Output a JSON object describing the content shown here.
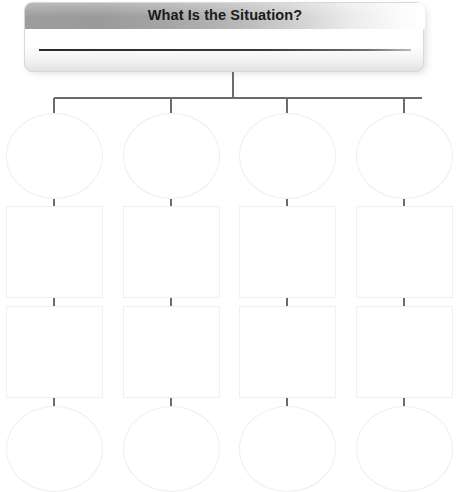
{
  "worksheet": {
    "header": {
      "title": "What Is the Situation?",
      "answer_line_value": "",
      "answer_line_placeholder": ""
    },
    "diagram": {
      "type": "tree-organizer",
      "branch_count": 4,
      "rows_per_branch": 4,
      "row_shapes": [
        "circle",
        "square",
        "square",
        "circle"
      ],
      "columns": [
        {
          "id": "branch-1",
          "nodes": [
            {
              "shape": "circle",
              "value": ""
            },
            {
              "shape": "square",
              "value": ""
            },
            {
              "shape": "square",
              "value": ""
            },
            {
              "shape": "circle",
              "value": ""
            }
          ]
        },
        {
          "id": "branch-2",
          "nodes": [
            {
              "shape": "circle",
              "value": ""
            },
            {
              "shape": "square",
              "value": ""
            },
            {
              "shape": "square",
              "value": ""
            },
            {
              "shape": "circle",
              "value": ""
            }
          ]
        },
        {
          "id": "branch-3",
          "nodes": [
            {
              "shape": "circle",
              "value": ""
            },
            {
              "shape": "square",
              "value": ""
            },
            {
              "shape": "square",
              "value": ""
            },
            {
              "shape": "circle",
              "value": ""
            }
          ]
        },
        {
          "id": "branch-4",
          "nodes": [
            {
              "shape": "circle",
              "value": ""
            },
            {
              "shape": "square",
              "value": ""
            },
            {
              "shape": "square",
              "value": ""
            },
            {
              "shape": "circle",
              "value": ""
            }
          ]
        }
      ]
    },
    "colors": {
      "title_bar_dark": "#9a9a9a",
      "title_bar_light": "#ffffff",
      "title_text": "#1a1a1a",
      "node_border": "#efefef",
      "connector_line": "#6b6b6b",
      "answer_rule": "#2b2b2b",
      "page_background": "#ffffff"
    }
  }
}
